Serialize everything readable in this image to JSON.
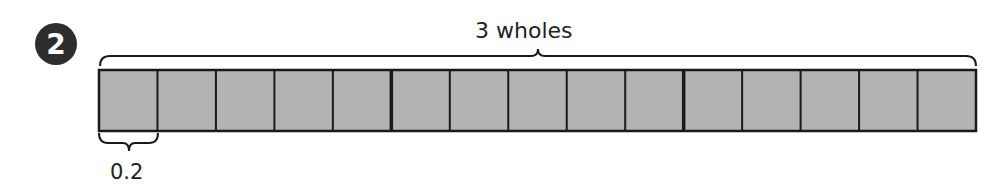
{
  "problem": {
    "number": "2",
    "total_label": "3 wholes",
    "unit_label": "0.2"
  },
  "chart_data": {
    "type": "bar-model",
    "title": "3 wholes",
    "wholes": 3,
    "parts_per_whole": 5,
    "total_parts": 15,
    "part_value": 0.2,
    "annotations": [
      "3 wholes",
      "0.2"
    ],
    "fill_color": "#b3b3b3",
    "stroke_color": "#1a1a1a"
  }
}
